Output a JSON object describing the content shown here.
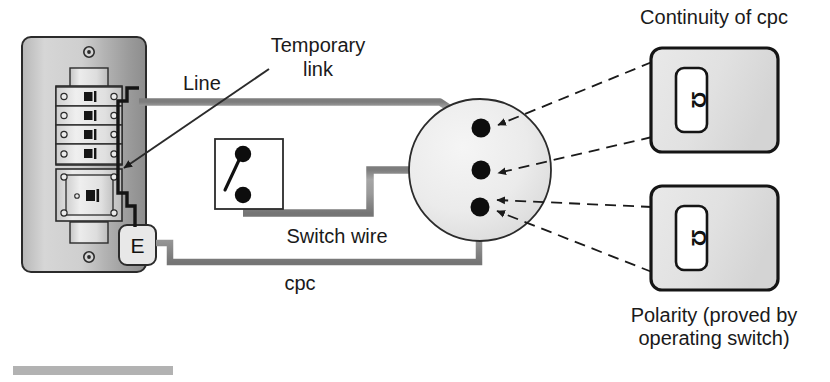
{
  "figure": {
    "type": "electrical-wiring-test-diagram",
    "background": "#ffffff"
  },
  "colors": {
    "wire_gray": "#9b9b9b",
    "wire_gray_edge": "#6f6f6f",
    "ink": "#1a1a1a",
    "panel_light": "#e2e2e2",
    "panel_mid": "#c9c9c9",
    "panel_dark": "#9d9d9d",
    "meter_fill": "#e3e3e3",
    "circle_fill": "#ececec",
    "terminal": "#0d0d0d",
    "artifact": "#b0b0b0"
  },
  "labels": {
    "line": "Line",
    "temporary_link_line1": "Temporary",
    "temporary_link_line2": "link",
    "switch_wire": "Switch wire",
    "cpc": "cpc",
    "earth_terminal": "E",
    "continuity_of_cpc": "Continuity of cpc",
    "polarity_line1": "Polarity (proved by",
    "polarity_line2": "operating switch)"
  },
  "consumer_unit": {
    "name": "consumer-unit",
    "screws": 2,
    "breakers": [
      {
        "index": 1
      },
      {
        "index": 2
      },
      {
        "index": 3
      },
      {
        "index": 4
      }
    ],
    "main_switch": {
      "index": 5
    }
  },
  "junction": {
    "name": "terminal-circle",
    "terminals": [
      {
        "id": "terminal-top",
        "label": "line terminal"
      },
      {
        "id": "terminal-middle",
        "label": "switch wire terminal"
      },
      {
        "id": "terminal-bottom",
        "label": "cpc terminal"
      }
    ]
  },
  "meters": [
    {
      "id": "meter-top",
      "display": "Ω",
      "caption": "Continuity of cpc"
    },
    {
      "id": "meter-bottom",
      "display": "Ω",
      "caption": "Polarity (proved by operating switch)"
    }
  ],
  "switch_box": {
    "name": "wall-switch",
    "terminals": 2
  }
}
